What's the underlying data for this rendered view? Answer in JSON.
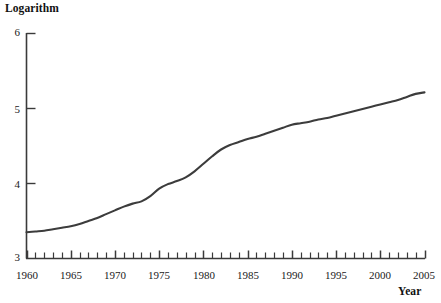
{
  "chart_data": {
    "type": "line",
    "title": "",
    "ylabel": "Logarithm",
    "xlabel": "Year",
    "xlim": [
      1960,
      2005
    ],
    "ylim": [
      3,
      6
    ],
    "grid": false,
    "legend": "none",
    "x_ticks_major": [
      1960,
      1965,
      1970,
      1975,
      1980,
      1985,
      1990,
      1995,
      2000,
      2005
    ],
    "x_ticks_minor_step": 1,
    "y_ticks": [
      3,
      4,
      5,
      6
    ],
    "x": [
      1960,
      1961,
      1962,
      1963,
      1964,
      1965,
      1966,
      1967,
      1968,
      1969,
      1970,
      1971,
      1972,
      1973,
      1974,
      1975,
      1976,
      1977,
      1978,
      1979,
      1980,
      1981,
      1982,
      1983,
      1984,
      1985,
      1986,
      1987,
      1988,
      1989,
      1990,
      1991,
      1992,
      1993,
      1994,
      1995,
      1996,
      1997,
      1998,
      1999,
      2000,
      2001,
      2002,
      2003,
      2004,
      2005
    ],
    "values": [
      3.35,
      3.36,
      3.37,
      3.39,
      3.41,
      3.43,
      3.46,
      3.5,
      3.54,
      3.59,
      3.64,
      3.69,
      3.73,
      3.76,
      3.83,
      3.93,
      3.99,
      4.03,
      4.08,
      4.16,
      4.26,
      4.36,
      4.45,
      4.51,
      4.55,
      4.59,
      4.62,
      4.66,
      4.7,
      4.74,
      4.78,
      4.8,
      4.82,
      4.85,
      4.87,
      4.9,
      4.93,
      4.96,
      4.99,
      5.02,
      5.05,
      5.08,
      5.11,
      5.15,
      5.19,
      5.21
    ],
    "series_color": "#3c3c3c",
    "axis_color": "#3a3a3a"
  },
  "axes": {
    "y_title": "Logarithm",
    "x_title": "Year",
    "y_tick_labels": [
      "6",
      "5",
      "4",
      "3"
    ],
    "x_tick_labels": [
      "1960",
      "1965",
      "1970",
      "1975",
      "1980",
      "1985",
      "1990",
      "1995",
      "2000",
      "2005"
    ]
  },
  "footnote": {
    "text": ""
  }
}
